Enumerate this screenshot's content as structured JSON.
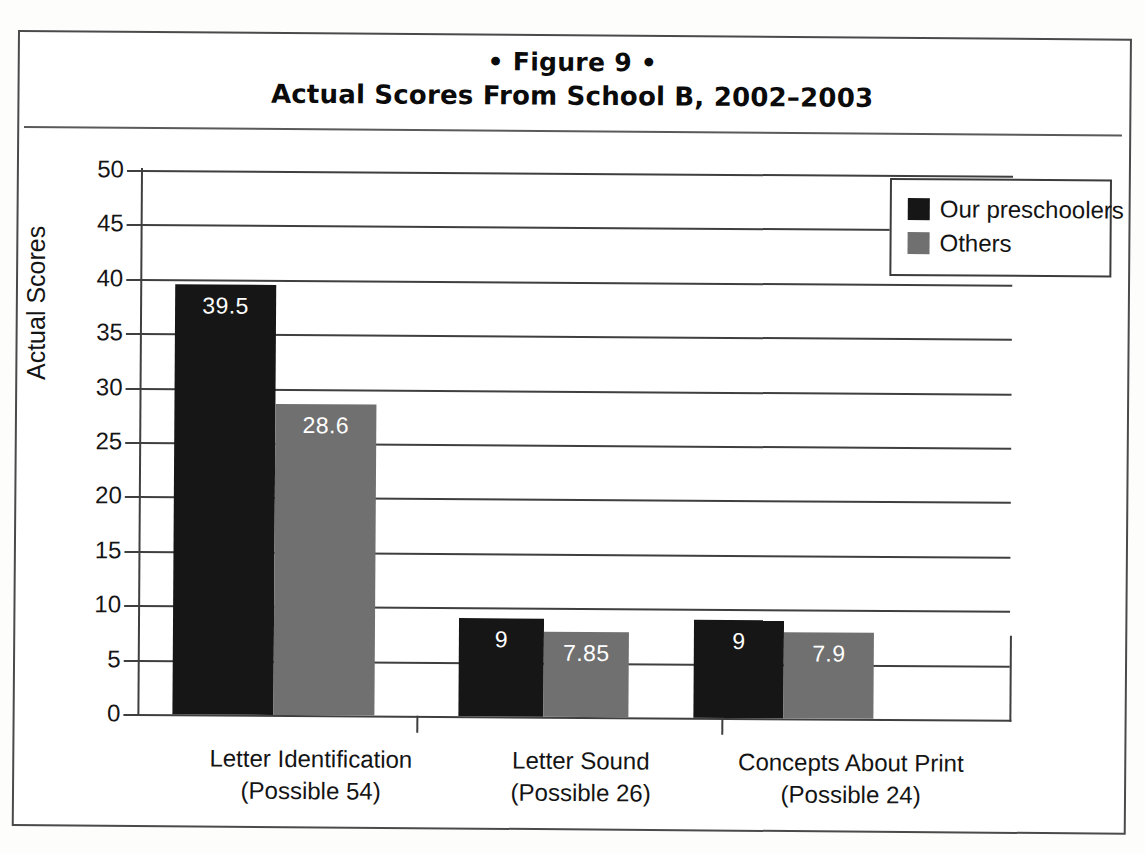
{
  "figure": {
    "number_line": "• Figure 9 •",
    "title": "Actual Scores From School B, 2002–2003"
  },
  "chart_data": {
    "type": "bar",
    "title": "Actual Scores From School B, 2002–2003",
    "subtitle": "• Figure 9 •",
    "xlabel": "",
    "ylabel": "Actual Scores",
    "ylim": [
      0,
      50
    ],
    "ytick_labels": [
      "50",
      "45",
      "40",
      "35",
      "30",
      "25",
      "20",
      "15",
      "10",
      "5",
      "0"
    ],
    "ytick_values": [
      50,
      45,
      40,
      35,
      30,
      25,
      20,
      15,
      10,
      5,
      0
    ],
    "grid": true,
    "legend_position": "top-right",
    "categories": [
      "Letter Identification\n(Possible 54)",
      "Letter Sound\n(Possible 26)",
      "Concepts About Print\n(Possible 24)"
    ],
    "category_lines": [
      {
        "name": "Letter Identification",
        "possible": "(Possible 54)"
      },
      {
        "name": "Letter Sound",
        "possible": "(Possible 26)"
      },
      {
        "name": "Concepts About Print",
        "possible": "(Possible 24)"
      }
    ],
    "series": [
      {
        "name": "Our preschoolers",
        "color": "#161616",
        "values": [
          39.5,
          9,
          9
        ],
        "labels": [
          "39.5",
          "9",
          "9"
        ]
      },
      {
        "name": "Others",
        "color": "#707070",
        "values": [
          28.6,
          7.85,
          7.9
        ],
        "labels": [
          "28.6",
          "7.85",
          "7.9"
        ]
      }
    ]
  },
  "legend": {
    "items": [
      {
        "label": "Our preschoolers",
        "color": "#161616"
      },
      {
        "label": "Others",
        "color": "#707070"
      }
    ]
  },
  "axis": {
    "y_title": "Actual Scores"
  }
}
